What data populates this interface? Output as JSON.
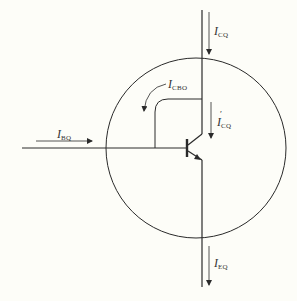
{
  "diagram": {
    "title": "",
    "colors": {
      "background": "#fdfdf8",
      "stroke": "#2a2a2a",
      "label": "#333333"
    },
    "circle": {
      "cx": 196,
      "cy": 148,
      "r": 90
    },
    "transistor": {
      "type": "npn",
      "base_bar_x": 187,
      "node_x": 202
    },
    "labels": {
      "icq_top": {
        "main": "I",
        "sub": "CQ"
      },
      "icbo": {
        "main": "I",
        "sub": "CBO"
      },
      "icq_prime": {
        "main": "I",
        "sub": "CQ",
        "prime": "′"
      },
      "ibq": {
        "main": "I",
        "sub": "BQ"
      },
      "ieq": {
        "main": "I",
        "sub": "EQ"
      }
    }
  }
}
